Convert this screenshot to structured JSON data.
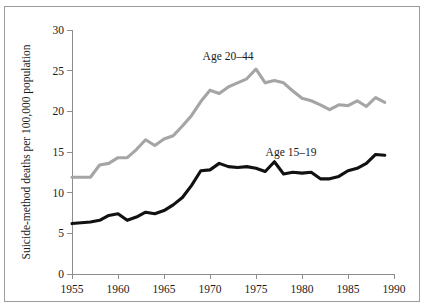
{
  "chart_data": {
    "type": "line",
    "title": "",
    "subtitle": "",
    "xlabel": "",
    "ylabel": "Suicide-method deaths per 100,000 population",
    "xlim": [
      1955,
      1990
    ],
    "ylim": [
      0,
      30
    ],
    "xticks": [
      1955,
      1960,
      1965,
      1970,
      1975,
      1980,
      1985,
      1990
    ],
    "xtick_labels": [
      "1955",
      "1960",
      "1965",
      "1970",
      "1975",
      "1980",
      "1985",
      "1990"
    ],
    "yticks": [
      0,
      5,
      10,
      15,
      20,
      25,
      30
    ],
    "ytick_labels": [
      "0",
      "5",
      "10",
      "15",
      "20",
      "25",
      "30"
    ],
    "grid": false,
    "legend_position": "inline-annotation",
    "x": [
      1955,
      1956,
      1957,
      1958,
      1959,
      1960,
      1961,
      1962,
      1963,
      1964,
      1965,
      1966,
      1967,
      1968,
      1969,
      1970,
      1971,
      1972,
      1973,
      1974,
      1975,
      1976,
      1977,
      1978,
      1979,
      1980,
      1981,
      1982,
      1983,
      1984,
      1985,
      1986,
      1987,
      1988,
      1989
    ],
    "series": [
      {
        "name": "Age 20-44",
        "label": "Age 20–44",
        "color": "#a5a5a5",
        "values": [
          11.9,
          11.9,
          11.9,
          13.4,
          13.6,
          14.3,
          14.3,
          15.3,
          16.5,
          15.8,
          16.6,
          17.0,
          18.2,
          19.5,
          21.2,
          22.6,
          22.2,
          23.0,
          23.5,
          24.0,
          25.2,
          23.5,
          23.8,
          23.5,
          22.5,
          21.6,
          21.3,
          20.8,
          20.2,
          20.8,
          20.7,
          21.3,
          20.6,
          21.7,
          21.1
        ]
      },
      {
        "name": "Age 15-19",
        "label": "Age 15–19",
        "color": "#111111",
        "values": [
          6.2,
          6.3,
          6.4,
          6.6,
          7.2,
          7.4,
          6.6,
          7.0,
          7.6,
          7.4,
          7.8,
          8.5,
          9.4,
          10.9,
          12.7,
          12.8,
          13.6,
          13.2,
          13.1,
          13.2,
          13.0,
          12.6,
          13.8,
          12.3,
          12.5,
          12.4,
          12.5,
          11.7,
          11.7,
          12.0,
          12.7,
          13.0,
          13.6,
          14.7,
          14.6
        ]
      }
    ],
    "annotations": [
      {
        "text": "Age 20–44",
        "x_pixel": 228,
        "y_pixel": 60,
        "series": "Age 20-44"
      },
      {
        "text": "Age 15–19",
        "x_pixel": 291,
        "y_pixel": 156,
        "series": "Age 15-19"
      }
    ],
    "colors": {
      "series_gray": "#a5a5a5",
      "series_black": "#111111",
      "axis": "#8d8d8d",
      "text": "#1a1a1a",
      "frame_border": "#9b9b9b",
      "background": "#ffffff"
    },
    "plot_area": {
      "left": 72,
      "right": 394,
      "top": 30,
      "bottom": 274
    }
  }
}
